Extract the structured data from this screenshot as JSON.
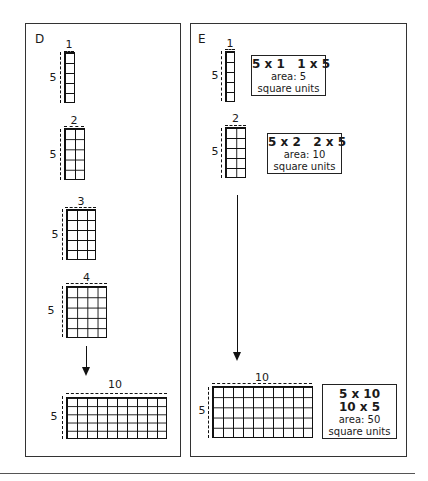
{
  "panels": {
    "d": {
      "label": "D",
      "rectangles": [
        {
          "width_label": "1",
          "height_label": "5",
          "cols": 1,
          "rows": 5
        },
        {
          "width_label": "2",
          "height_label": "5",
          "cols": 2,
          "rows": 5
        },
        {
          "width_label": "3",
          "height_label": "5",
          "cols": 3,
          "rows": 5
        },
        {
          "width_label": "4",
          "height_label": "5",
          "cols": 4,
          "rows": 5
        },
        {
          "width_label": "10",
          "height_label": "5",
          "cols": 10,
          "rows": 5
        }
      ]
    },
    "e": {
      "label": "E",
      "rectangles": [
        {
          "width_label": "1",
          "height_label": "5",
          "cols": 1,
          "rows": 5,
          "info": {
            "expr": "5 x 1   1 x 5",
            "area": "area: 5",
            "units": "square units"
          }
        },
        {
          "width_label": "2",
          "height_label": "5",
          "cols": 2,
          "rows": 5,
          "info": {
            "expr": "5 x 2   2 x 5",
            "area": "area: 10",
            "units": "square units"
          }
        },
        {
          "width_label": "10",
          "height_label": "5",
          "cols": 10,
          "rows": 5,
          "info": {
            "expr1": "5 x 10",
            "expr2": "10 x 5",
            "area": "area: 50",
            "units": "square units"
          }
        }
      ]
    }
  }
}
